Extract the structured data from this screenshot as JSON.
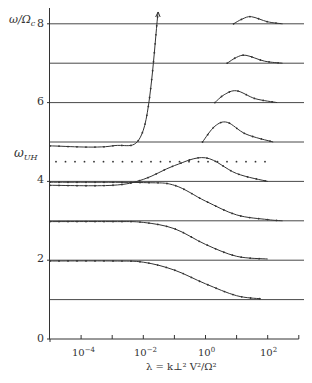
{
  "chart_data": {
    "type": "line",
    "title": "",
    "xlabel": "λ = k⊥² V²/Ω²",
    "ylabel": "ω/Ωc",
    "x_scale": "log",
    "xlim": [
      1e-05,
      1000.0
    ],
    "ylim": [
      0,
      8.3
    ],
    "x_tick_labels": [
      "10⁻⁴",
      "10⁻²",
      "10⁰",
      "10²"
    ],
    "x_ticks": [
      0.0001,
      0.001,
      0.01,
      0.1,
      1,
      10,
      100,
      1000
    ],
    "y_tick_labels": [
      "0",
      "2",
      "4",
      "6",
      "8"
    ],
    "y_ticks": [
      0,
      2,
      4,
      6,
      8
    ],
    "annotations": [
      {
        "text": "ωUH",
        "y": 4.5,
        "style": "dotted horizontal line"
      }
    ],
    "harmonic_lines": [
      1,
      2,
      3,
      4,
      5,
      6,
      7,
      8
    ],
    "series": [
      {
        "name": "branch 1-2",
        "x": [
          1e-05,
          0.001,
          0.01,
          0.1,
          1,
          10,
          60
        ],
        "y": [
          1.98,
          1.98,
          1.95,
          1.75,
          1.4,
          1.1,
          1.02
        ]
      },
      {
        "name": "branch 2-3",
        "x": [
          1e-05,
          0.001,
          0.01,
          0.1,
          1,
          10,
          100
        ],
        "y": [
          2.98,
          2.98,
          2.96,
          2.8,
          2.4,
          2.1,
          2.03
        ]
      },
      {
        "name": "branch 3-4",
        "x": [
          1e-05,
          0.01,
          0.1,
          1,
          10,
          100,
          300
        ],
        "y": [
          3.98,
          3.97,
          3.9,
          3.5,
          3.15,
          3.03,
          3.0
        ]
      },
      {
        "name": "branch 4 (hybrid)",
        "x": [
          1e-05,
          0.001,
          0.01,
          0.1,
          1,
          10,
          100
        ],
        "y": [
          3.9,
          3.9,
          4.05,
          4.4,
          4.6,
          4.2,
          4.0
        ]
      },
      {
        "name": "branch 5",
        "x": [
          1e-05,
          0.001,
          0.01,
          0.03
        ],
        "y": [
          4.9,
          4.9,
          5.3,
          8.3
        ]
      },
      {
        "name": "branch 5-6 bump",
        "x": [
          0.8,
          2,
          5,
          20,
          150
        ],
        "y": [
          5.0,
          5.4,
          5.5,
          5.2,
          5.0
        ]
      },
      {
        "name": "branch 6-7 bump",
        "x": [
          2,
          4,
          10,
          40,
          200
        ],
        "y": [
          6.0,
          6.2,
          6.3,
          6.1,
          6.0
        ]
      },
      {
        "name": "branch 7-8 bump",
        "x": [
          5,
          10,
          20,
          80,
          300
        ],
        "y": [
          7.0,
          7.15,
          7.2,
          7.05,
          7.0
        ]
      },
      {
        "name": "branch 8-9 bump",
        "x": [
          8,
          15,
          30,
          100,
          300
        ],
        "y": [
          8.0,
          8.12,
          8.18,
          8.05,
          8.0
        ]
      }
    ]
  },
  "labels": {
    "ylabel_main": "ω/Ω",
    "ylabel_sub": "c",
    "uh_main": "ω",
    "uh_sub": "UH",
    "y0": "0",
    "y2": "2",
    "y4": "4",
    "y6": "6",
    "y8": "8",
    "x_m4_base": "10",
    "x_m4_exp": "−4",
    "x_m2_base": "10",
    "x_m2_exp": "−2",
    "x_0_base": "10",
    "x_0_exp": "0",
    "x_2_base": "10",
    "x_2_exp": "2",
    "xlabel": "λ = k⊥² V²/Ω²"
  },
  "colors": {
    "ink": "#333333",
    "background": "#ffffff"
  }
}
